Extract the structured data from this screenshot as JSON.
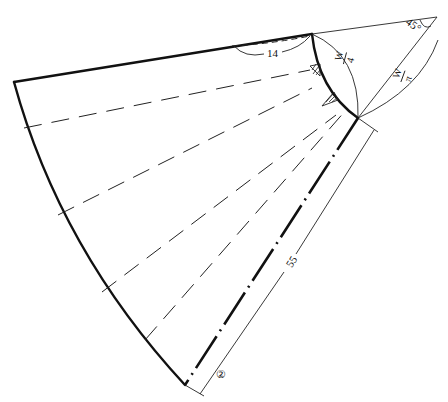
{
  "diagram": {
    "type": "skirt pattern piece (flared panel)",
    "labels": {
      "angle": "45°",
      "waist_extension": "14",
      "waist_arc_num": "W",
      "waist_arc_den": "4",
      "radius_num": "W",
      "radius_den": "π",
      "length": "55",
      "piece_number": "②"
    },
    "colors": {
      "line": "#111111",
      "background": "#ffffff"
    },
    "elements": [
      "apex with 45° angle arc",
      "top edge (thick, continuing thin to apex)",
      "waist curve (thick arc)",
      "hem curve (thick arc)",
      "center line (thick dash-dot)",
      "dimension line for length 55",
      "radius arc labelled W/π",
      "waist arc labelled W/4",
      "dashed slash/spread lines",
      "hatched darts near waist"
    ]
  }
}
